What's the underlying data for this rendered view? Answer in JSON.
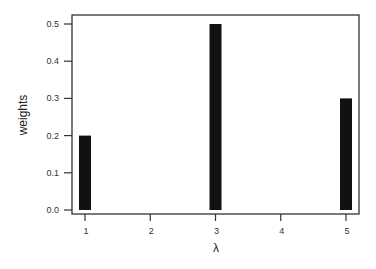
{
  "chart_data": {
    "type": "bar",
    "title": "",
    "xlabel": "λ",
    "ylabel": "weights",
    "categories": [
      1,
      2,
      3,
      4,
      5
    ],
    "values": [
      0.2,
      0.0,
      0.5,
      0.0,
      0.3
    ],
    "x_ticks": [
      "1",
      "2",
      "3",
      "4",
      "5"
    ],
    "y_ticks": [
      "0.0",
      "0.1",
      "0.2",
      "0.3",
      "0.4",
      "0.5"
    ],
    "ylim": [
      0,
      0.5
    ],
    "xlim": [
      1,
      5
    ],
    "grid": false,
    "legend": null,
    "bar_color": "#111111"
  }
}
